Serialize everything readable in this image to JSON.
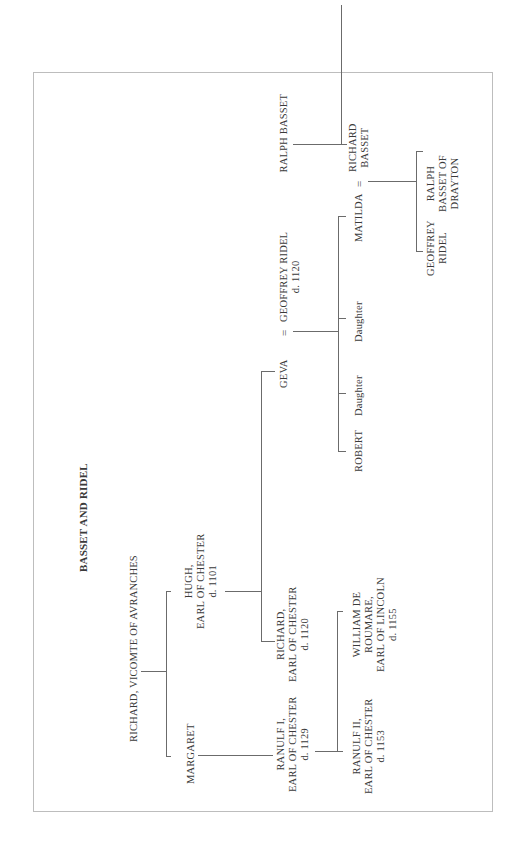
{
  "chart": {
    "title": "BASSET AND RIDEL",
    "people": {
      "richard_vicomte": "RICHARD, VICOMTE OF AVRANCHES",
      "margaret": "MARGARET",
      "hugh": [
        "HUGH,",
        "EARL OF CHESTER",
        "d. 1101"
      ],
      "ranulf_i": [
        "RANULF I,",
        "EARL OF CHESTER",
        "d. 1129"
      ],
      "richard_earl": [
        "RICHARD,",
        "EARL OF CHESTER",
        "d. 1120"
      ],
      "ranulf_ii": [
        "RANULF II,",
        "EARL OF CHESTER",
        "d. 1153"
      ],
      "william": [
        "WILLIAM DE",
        "ROUMARE,",
        "EARL OF LINCOLN",
        "d. 1155"
      ],
      "geva": "GEVA",
      "marriage_sign": "=",
      "geoffrey_ridel": [
        "GEOFFREY RIDEL",
        "d. 1120"
      ],
      "robert": "ROBERT",
      "daughter1": "Daughter",
      "daughter2": "Daughter",
      "matilda": "MATILDA",
      "marriage_sign2": "=",
      "richard_basset": [
        "RICHARD",
        "BASSET"
      ],
      "ralph_basset": "RALPH BASSET",
      "rb_daughter1": "Daughter",
      "rb_daughter2": "Daughter",
      "rb_granddaughter": "Daughter",
      "geoffrey_ridel_jr": [
        "GEOFFREY",
        "RIDEL"
      ],
      "ralph_drayton": [
        "RALPH",
        "BASSET OF",
        "DRAYTON"
      ]
    }
  }
}
